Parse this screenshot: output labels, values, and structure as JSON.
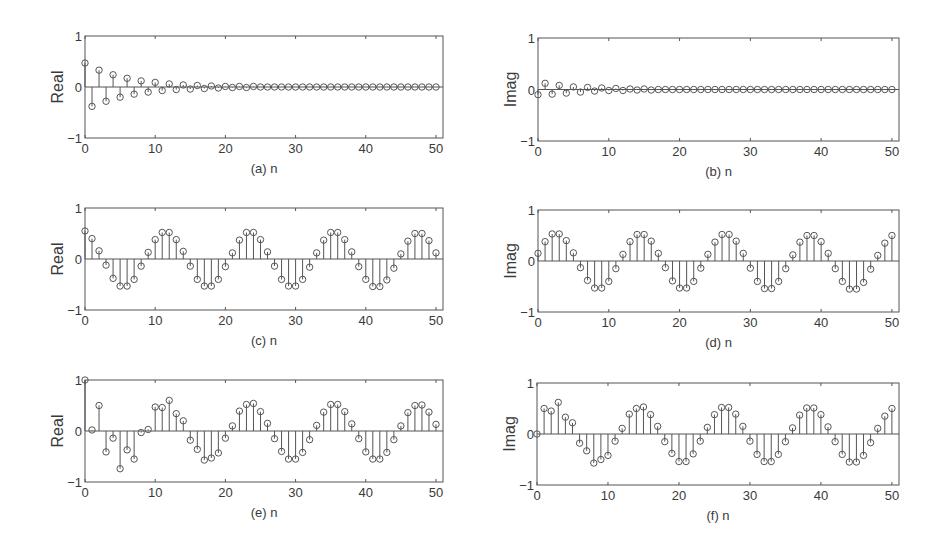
{
  "figure": {
    "background": "#ffffff",
    "line_color": "#555555",
    "marker": "circle-open"
  },
  "chart_data": [
    {
      "id": "a",
      "type": "stem",
      "caption": "(a) n",
      "xlabel": "n",
      "ylabel": "Real",
      "xlim": [
        0,
        51
      ],
      "ylim": [
        -1,
        1
      ],
      "xticks": [
        0,
        10,
        20,
        30,
        40,
        50
      ],
      "yticks": [
        -1,
        0,
        1
      ],
      "ytick_labels": [
        "−1",
        "0",
        "1"
      ],
      "grid": false,
      "x": [
        0,
        1,
        2,
        3,
        4,
        5,
        6,
        7,
        8,
        9,
        10,
        11,
        12,
        13,
        14,
        15,
        16,
        17,
        18,
        19,
        20,
        21,
        22,
        23,
        24,
        25,
        26,
        27,
        28,
        29,
        30,
        31,
        32,
        33,
        34,
        35,
        36,
        37,
        38,
        39,
        40,
        41,
        42,
        43,
        44,
        45,
        46,
        47,
        48,
        49,
        50
      ],
      "values": [
        0.47,
        -0.38,
        0.33,
        -0.28,
        0.24,
        -0.2,
        0.17,
        -0.14,
        0.12,
        -0.1,
        0.09,
        -0.07,
        0.06,
        -0.05,
        0.04,
        -0.04,
        0.03,
        -0.03,
        0.02,
        -0.02,
        0.01,
        -0.01,
        0.01,
        -0.01,
        0.01,
        0,
        0,
        0,
        0,
        0,
        0,
        0,
        0,
        0,
        0,
        0,
        0,
        0,
        0,
        0,
        0,
        0,
        0,
        0,
        0,
        0,
        0,
        0,
        0,
        0,
        0
      ]
    },
    {
      "id": "b",
      "type": "stem",
      "caption": "(b) n",
      "xlabel": "n",
      "ylabel": "Imag",
      "xlim": [
        0,
        51
      ],
      "ylim": [
        -1,
        1
      ],
      "xticks": [
        0,
        10,
        20,
        30,
        40,
        50
      ],
      "yticks": [
        -1,
        0,
        1
      ],
      "ytick_labels": [
        "−1",
        "0",
        "1"
      ],
      "grid": false,
      "x": [
        0,
        1,
        2,
        3,
        4,
        5,
        6,
        7,
        8,
        9,
        10,
        11,
        12,
        13,
        14,
        15,
        16,
        17,
        18,
        19,
        20,
        21,
        22,
        23,
        24,
        25,
        26,
        27,
        28,
        29,
        30,
        31,
        32,
        33,
        34,
        35,
        36,
        37,
        38,
        39,
        40,
        41,
        42,
        43,
        44,
        45,
        46,
        47,
        48,
        49,
        50
      ],
      "values": [
        -0.1,
        0.12,
        -0.09,
        0.08,
        -0.07,
        0.05,
        -0.05,
        0.04,
        -0.03,
        0.03,
        -0.02,
        0.02,
        -0.02,
        0.01,
        -0.01,
        0.01,
        -0.01,
        0,
        0,
        0,
        0,
        0,
        0,
        0,
        0,
        0,
        0,
        0,
        0,
        0,
        0,
        0,
        0,
        0,
        0,
        0,
        0,
        0,
        0,
        0,
        0,
        0,
        0,
        0,
        0,
        0,
        0,
        0,
        0,
        0,
        0
      ]
    },
    {
      "id": "c",
      "type": "stem",
      "caption": "(c) n",
      "xlabel": "n",
      "ylabel": "Real",
      "xlim": [
        0,
        51
      ],
      "ylim": [
        -1,
        1
      ],
      "xticks": [
        0,
        10,
        20,
        30,
        40,
        50
      ],
      "yticks": [
        -1,
        0,
        1
      ],
      "ytick_labels": [
        "−1",
        "0",
        "1"
      ],
      "grid": false,
      "x": [
        0,
        1,
        2,
        3,
        4,
        5,
        6,
        7,
        8,
        9,
        10,
        11,
        12,
        13,
        14,
        15,
        16,
        17,
        18,
        19,
        20,
        21,
        22,
        23,
        24,
        25,
        26,
        27,
        28,
        29,
        30,
        31,
        32,
        33,
        34,
        35,
        36,
        37,
        38,
        39,
        40,
        41,
        42,
        43,
        44,
        45,
        46,
        47,
        48,
        49,
        50
      ],
      "values": [
        0.55,
        0.4,
        0.16,
        -0.12,
        -0.38,
        -0.53,
        -0.53,
        -0.4,
        -0.14,
        0.13,
        0.38,
        0.52,
        0.52,
        0.38,
        0.15,
        -0.14,
        -0.4,
        -0.53,
        -0.53,
        -0.4,
        -0.15,
        0.12,
        0.37,
        0.52,
        0.52,
        0.38,
        0.14,
        -0.14,
        -0.4,
        -0.53,
        -0.53,
        -0.4,
        -0.16,
        0.12,
        0.37,
        0.52,
        0.52,
        0.38,
        0.14,
        -0.15,
        -0.4,
        -0.54,
        -0.54,
        -0.41,
        -0.18,
        0.1,
        0.35,
        0.5,
        0.5,
        0.36,
        0.12
      ]
    },
    {
      "id": "d",
      "type": "stem",
      "caption": "(d) n",
      "xlabel": "n",
      "ylabel": "Imag",
      "xlim": [
        0,
        51
      ],
      "ylim": [
        -1,
        1
      ],
      "xticks": [
        0,
        10,
        20,
        30,
        40,
        50
      ],
      "yticks": [
        -1,
        0,
        1
      ],
      "ytick_labels": [
        "−1",
        "0",
        "1"
      ],
      "grid": false,
      "x": [
        0,
        1,
        2,
        3,
        4,
        5,
        6,
        7,
        8,
        9,
        10,
        11,
        12,
        13,
        14,
        15,
        16,
        17,
        18,
        19,
        20,
        21,
        22,
        23,
        24,
        25,
        26,
        27,
        28,
        29,
        30,
        31,
        32,
        33,
        34,
        35,
        36,
        37,
        38,
        39,
        40,
        41,
        42,
        43,
        44,
        45,
        46,
        47,
        48,
        49,
        50
      ],
      "values": [
        0.15,
        0.38,
        0.53,
        0.53,
        0.4,
        0.16,
        -0.13,
        -0.38,
        -0.53,
        -0.53,
        -0.4,
        -0.15,
        0.13,
        0.38,
        0.52,
        0.52,
        0.39,
        0.15,
        -0.13,
        -0.39,
        -0.53,
        -0.53,
        -0.4,
        -0.14,
        0.13,
        0.37,
        0.52,
        0.52,
        0.39,
        0.15,
        -0.14,
        -0.4,
        -0.54,
        -0.54,
        -0.4,
        -0.15,
        0.12,
        0.37,
        0.5,
        0.5,
        0.38,
        0.15,
        -0.15,
        -0.4,
        -0.55,
        -0.55,
        -0.42,
        -0.16,
        0.11,
        0.35,
        0.5
      ]
    },
    {
      "id": "e",
      "type": "stem",
      "caption": "(e) n",
      "xlabel": "n",
      "ylabel": "Real",
      "xlim": [
        0,
        51
      ],
      "ylim": [
        -1,
        1
      ],
      "xticks": [
        0,
        10,
        20,
        30,
        40,
        50
      ],
      "yticks": [
        -1,
        0,
        1
      ],
      "ytick_labels": [
        "−1",
        "0",
        "1"
      ],
      "grid": false,
      "x": [
        0,
        1,
        2,
        3,
        4,
        5,
        6,
        7,
        8,
        9,
        10,
        11,
        12,
        13,
        14,
        15,
        16,
        17,
        18,
        19,
        20,
        21,
        22,
        23,
        24,
        25,
        26,
        27,
        28,
        29,
        30,
        31,
        32,
        33,
        34,
        35,
        36,
        37,
        38,
        39,
        40,
        41,
        42,
        43,
        44,
        45,
        46,
        47,
        48,
        49,
        50
      ],
      "values": [
        1.0,
        0.02,
        0.5,
        -0.41,
        -0.14,
        -0.74,
        -0.37,
        -0.55,
        -0.03,
        0.03,
        0.47,
        0.46,
        0.6,
        0.34,
        0.2,
        -0.18,
        -0.36,
        -0.57,
        -0.53,
        -0.43,
        -0.14,
        0.1,
        0.39,
        0.52,
        0.54,
        0.38,
        0.15,
        -0.15,
        -0.4,
        -0.55,
        -0.55,
        -0.42,
        -0.17,
        0.11,
        0.37,
        0.52,
        0.52,
        0.38,
        0.14,
        -0.15,
        -0.41,
        -0.55,
        -0.55,
        -0.42,
        -0.17,
        0.1,
        0.36,
        0.5,
        0.51,
        0.37,
        0.13
      ]
    },
    {
      "id": "f",
      "type": "stem",
      "caption": "(f) n",
      "xlabel": "n",
      "ylabel": "Imag",
      "xlim": [
        0,
        51
      ],
      "ylim": [
        -1,
        1
      ],
      "xticks": [
        0,
        10,
        20,
        30,
        40,
        50
      ],
      "yticks": [
        -1,
        0,
        1
      ],
      "ytick_labels": [
        "−1",
        "0",
        "1"
      ],
      "grid": false,
      "x": [
        0,
        1,
        2,
        3,
        4,
        5,
        6,
        7,
        8,
        9,
        10,
        11,
        12,
        13,
        14,
        15,
        16,
        17,
        18,
        19,
        20,
        21,
        22,
        23,
        24,
        25,
        26,
        27,
        28,
        29,
        30,
        31,
        32,
        33,
        34,
        35,
        36,
        37,
        38,
        39,
        40,
        41,
        42,
        43,
        44,
        45,
        46,
        47,
        48,
        49,
        50
      ],
      "values": [
        0.0,
        0.5,
        0.45,
        0.62,
        0.33,
        0.22,
        -0.18,
        -0.33,
        -0.57,
        -0.5,
        -0.42,
        -0.14,
        0.11,
        0.39,
        0.5,
        0.53,
        0.38,
        0.15,
        -0.15,
        -0.38,
        -0.54,
        -0.54,
        -0.39,
        -0.14,
        0.13,
        0.38,
        0.52,
        0.52,
        0.39,
        0.15,
        -0.14,
        -0.4,
        -0.54,
        -0.54,
        -0.4,
        -0.15,
        0.12,
        0.37,
        0.51,
        0.51,
        0.38,
        0.14,
        -0.15,
        -0.4,
        -0.55,
        -0.55,
        -0.42,
        -0.17,
        0.11,
        0.35,
        0.5
      ]
    }
  ],
  "layout": [
    {
      "id": "a",
      "left": 85,
      "right": 443,
      "top": 36,
      "bottom": 138
    },
    {
      "id": "b",
      "left": 538,
      "right": 899,
      "top": 38,
      "bottom": 141
    },
    {
      "id": "c",
      "left": 85,
      "right": 443,
      "top": 208,
      "bottom": 310
    },
    {
      "id": "d",
      "left": 538,
      "right": 899,
      "top": 210,
      "bottom": 312
    },
    {
      "id": "e",
      "left": 85,
      "right": 443,
      "top": 380,
      "bottom": 482
    },
    {
      "id": "f",
      "left": 537,
      "right": 899,
      "top": 383,
      "bottom": 485
    }
  ]
}
